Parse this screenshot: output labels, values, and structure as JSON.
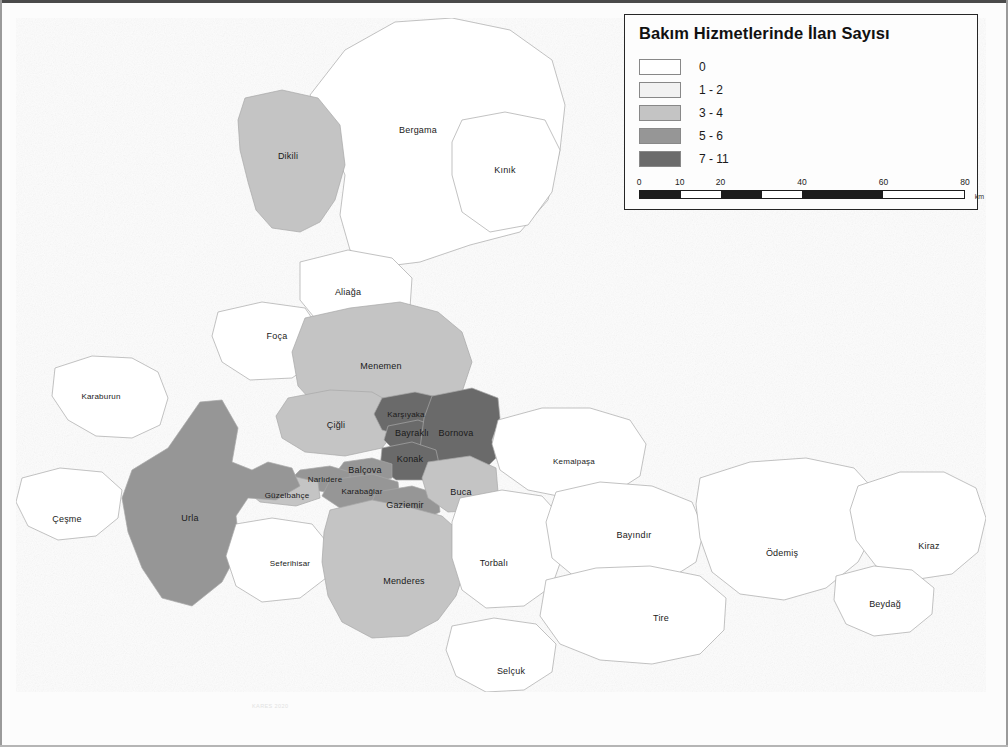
{
  "map": {
    "title": "Bakım Hizmetlerinde İlan Sayısı",
    "watermark": "KARES 2020",
    "background_color": "#fcfcfc",
    "border_color": "#4a4a4a"
  },
  "legend": {
    "title": "Bakım Hizmetlerinde İlan Sayısı",
    "classes": [
      {
        "label": "0",
        "color": "#ffffff",
        "min": 0,
        "max": 0
      },
      {
        "label": "1 - 2",
        "color": "#f2f2f2",
        "min": 1,
        "max": 2
      },
      {
        "label": "3 - 4",
        "color": "#c4c4c4",
        "min": 3,
        "max": 4
      },
      {
        "label": "5 - 6",
        "color": "#969696",
        "min": 5,
        "max": 6
      },
      {
        "label": "7 - 11",
        "color": "#6b6b6b",
        "min": 7,
        "max": 11
      }
    ]
  },
  "compass": {
    "name": "north-arrow",
    "north": "K",
    "south": "G",
    "east": "D",
    "west": "B"
  },
  "scale": {
    "ticks": [
      "0",
      "10",
      "20",
      "40",
      "60",
      "80"
    ],
    "unit": "km",
    "max": 80
  },
  "districts": [
    {
      "name": "Bergama",
      "class": 0,
      "label_x": 418,
      "label_y": 130
    },
    {
      "name": "Kınık",
      "class": 0,
      "label_x": 505,
      "label_y": 170
    },
    {
      "name": "Dikili",
      "class": 2,
      "label_x": 288,
      "label_y": 156
    },
    {
      "name": "Aliağa",
      "class": 0,
      "label_x": 348,
      "label_y": 292
    },
    {
      "name": "Foça",
      "class": 0,
      "label_x": 277,
      "label_y": 336
    },
    {
      "name": "Menemen",
      "class": 2,
      "label_x": 381,
      "label_y": 366
    },
    {
      "name": "Çiğli",
      "class": 2,
      "label_x": 336,
      "label_y": 425
    },
    {
      "name": "Karşıyaka",
      "class": 4,
      "label_x": 406,
      "label_y": 414
    },
    {
      "name": "Bayraklı",
      "class": 4,
      "label_x": 412,
      "label_y": 433
    },
    {
      "name": "Bornova",
      "class": 4,
      "label_x": 456,
      "label_y": 433
    },
    {
      "name": "Konak",
      "class": 4,
      "label_x": 410,
      "label_y": 459
    },
    {
      "name": "Balçova",
      "class": 3,
      "label_x": 365,
      "label_y": 470
    },
    {
      "name": "Narlıdere",
      "class": 3,
      "label_x": 325,
      "label_y": 479
    },
    {
      "name": "Güzelbahçe",
      "class": 2,
      "label_x": 287,
      "label_y": 495
    },
    {
      "name": "Karabağlar",
      "class": 3,
      "label_x": 362,
      "label_y": 491
    },
    {
      "name": "Gaziemir",
      "class": 3,
      "label_x": 405,
      "label_y": 505
    },
    {
      "name": "Buca",
      "class": 2,
      "label_x": 461,
      "label_y": 492
    },
    {
      "name": "Karaburun",
      "class": 0,
      "label_x": 101,
      "label_y": 396
    },
    {
      "name": "Çeşme",
      "class": 0,
      "label_x": 67,
      "label_y": 519
    },
    {
      "name": "Urla",
      "class": 3,
      "label_x": 190,
      "label_y": 518
    },
    {
      "name": "Seferihisar",
      "class": 0,
      "label_x": 290,
      "label_y": 563
    },
    {
      "name": "Menderes",
      "class": 2,
      "label_x": 404,
      "label_y": 581
    },
    {
      "name": "Torbalı",
      "class": 0,
      "label_x": 494,
      "label_y": 563
    },
    {
      "name": "Selçuk",
      "class": 0,
      "label_x": 511,
      "label_y": 671
    },
    {
      "name": "Kemalpaşa",
      "class": 0,
      "label_x": 574,
      "label_y": 461
    },
    {
      "name": "Bayındır",
      "class": 0,
      "label_x": 634,
      "label_y": 535
    },
    {
      "name": "Tire",
      "class": 0,
      "label_x": 661,
      "label_y": 618
    },
    {
      "name": "Ödemiş",
      "class": 0,
      "label_x": 782,
      "label_y": 553
    },
    {
      "name": "Kiraz",
      "class": 0,
      "label_x": 929,
      "label_y": 546
    },
    {
      "name": "Beydağ",
      "class": 0,
      "label_x": 885,
      "label_y": 604
    }
  ]
}
